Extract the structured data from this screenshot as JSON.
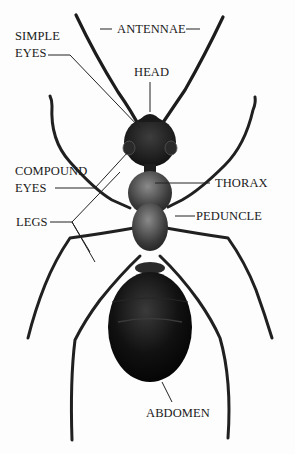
{
  "diagram": {
    "labels": {
      "antennae": "ANTENNAE",
      "simple_eyes_line1": "SIMPLE",
      "simple_eyes_line2": "EYES",
      "head": "HEAD",
      "compound_eyes_line1": "COMPOUND",
      "compound_eyes_line2": "EYES",
      "thorax": "THORAX",
      "legs": "LEGS",
      "peduncle": "PEDUNCLE",
      "abdomen": "ABDOMEN"
    },
    "colors": {
      "body": "#1c1c1c",
      "thorax": "#4a4a4a",
      "abdomen": "#0d0d0d",
      "leader_lines": "#222222",
      "background": "#fdfdfd"
    }
  }
}
